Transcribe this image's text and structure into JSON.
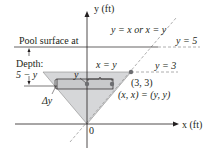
{
  "labels": {
    "y_axis": "y (ft)",
    "x_axis": "x (ft)",
    "origin": "0",
    "pool_surface": "Pool surface at",
    "depth": "Depth:",
    "depth_expr": "5 − y",
    "line_yx": "y = x or x = y",
    "line_y5": "y = 5",
    "line_y3": "y = 3",
    "width_label": "x = y",
    "y_label": "y",
    "point_33": "(3, 3)",
    "point_xx": "(x, x) = (y, y)",
    "delta_y": "Δy"
  },
  "colors": {
    "triangle_fill": "#d6d7d9",
    "strip_fill": "#c8c9cb",
    "line": "#231f20",
    "dashed": "#9a9a9a",
    "point": "#6d6e71"
  }
}
